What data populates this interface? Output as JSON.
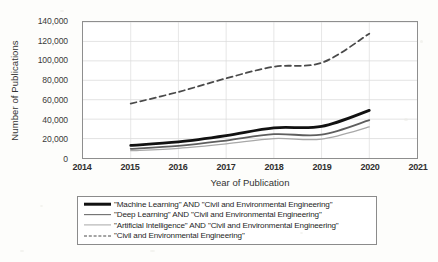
{
  "chart_data": {
    "type": "line",
    "title": "",
    "xlabel": "Year of Publication",
    "ylabel": "Number of Publications",
    "x": [
      2015,
      2016,
      2017,
      2018,
      2019,
      2020
    ],
    "xlim": [
      2014,
      2021
    ],
    "ylim": [
      0,
      140000
    ],
    "grid": true,
    "legend_position": "below-plot",
    "xticks": [
      "2014",
      "2015",
      "2016",
      "2017",
      "2018",
      "2019",
      "2020",
      "2021"
    ],
    "yticks": [
      "0",
      "20,000",
      "40,000",
      "60,000",
      "80,000",
      "100,000",
      "120,000",
      "140,000"
    ],
    "series": [
      {
        "name": "\"Machine Learning\" AND  \"Civil and Environmental Engineering\"",
        "values": [
          13000,
          16500,
          23000,
          31000,
          32500,
          49000
        ],
        "color": "#111111",
        "style": "solid",
        "width": 2.8
      },
      {
        "name": "\"Deep Learning\" AND \"Civil and Environmental Engineering\"",
        "values": [
          9500,
          12500,
          18000,
          24500,
          24000,
          39000
        ],
        "color": "#5e5e5e",
        "style": "solid",
        "width": 1.8
      },
      {
        "name": "\"Artificial Intelligence\" AND \"Civil and Environmental Engineering\"",
        "values": [
          7500,
          10000,
          14500,
          20000,
          19500,
          32000
        ],
        "color": "#a8a8a8",
        "style": "solid",
        "width": 1.3
      },
      {
        "name": "\"Civil and Environmental Engineering\"",
        "values": [
          56000,
          68000,
          82000,
          94000,
          98000,
          128000
        ],
        "color": "#4a4a4a",
        "style": "dashed",
        "width": 1.8
      }
    ]
  },
  "legend": {
    "items": [
      {
        "label": "\"Machine Learning\" AND  \"Civil and Environmental Engineering\""
      },
      {
        "label": "\"Deep Learning\" AND \"Civil and Environmental Engineering\""
      },
      {
        "label": "\"Artificial Intelligence\" AND \"Civil and Environmental Engineering\""
      },
      {
        "label": "\"Civil and Environmental Engineering\""
      }
    ]
  }
}
